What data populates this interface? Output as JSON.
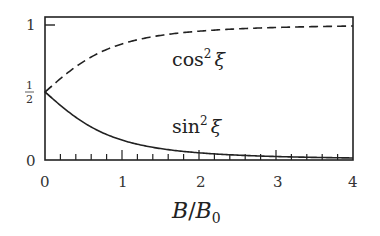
{
  "chart_data": {
    "type": "line",
    "title": "",
    "xlabel": "B/B0",
    "ylabel": "",
    "xlim": [
      0,
      4
    ],
    "ylim": [
      0,
      1
    ],
    "grid": false,
    "legend": "inline labels",
    "x_ticks": [
      "0",
      "1",
      "2",
      "3",
      "4"
    ],
    "y_ticks": [
      "0",
      "1/2",
      "1"
    ],
    "x": [
      0,
      0.25,
      0.5,
      0.75,
      1,
      1.5,
      2,
      2.5,
      3,
      3.5,
      4
    ],
    "series": [
      {
        "name": "cos²ξ",
        "style": "dashed",
        "values": [
          0.5,
          0.621,
          0.724,
          0.8,
          0.854,
          0.916,
          0.947,
          0.964,
          0.974,
          0.981,
          0.985
        ]
      },
      {
        "name": "sin²ξ",
        "style": "solid",
        "values": [
          0.5,
          0.379,
          0.276,
          0.2,
          0.146,
          0.084,
          0.053,
          0.036,
          0.026,
          0.019,
          0.015
        ]
      }
    ]
  },
  "labels": {
    "cos_label": "cos",
    "sin_label": "sin",
    "exp": "2",
    "xi": "ξ",
    "xlabel_b": "B",
    "xlabel_slash": "/",
    "xlabel_b0": "B",
    "xlabel_sub": "0",
    "ytick_0": "0",
    "ytick_1": "1",
    "ytick_half_num": "1",
    "ytick_half_den": "2",
    "xtick_0": "0",
    "xtick_1": "1",
    "xtick_2": "2",
    "xtick_3": "3",
    "xtick_4": "4"
  }
}
